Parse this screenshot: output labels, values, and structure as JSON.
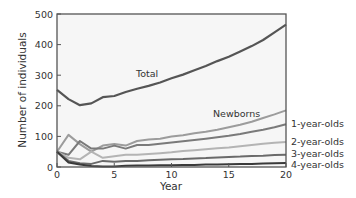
{
  "chart_data": {
    "type": "line",
    "title": "",
    "xlabel": "Year",
    "ylabel": "Number of individuals",
    "xlim": [
      0,
      20
    ],
    "ylim": [
      0,
      500
    ],
    "xticks": [
      0,
      5,
      10,
      15,
      20
    ],
    "yticks": [
      0,
      100,
      200,
      300,
      400,
      500
    ],
    "grid": false,
    "legend": "inline labels",
    "x": [
      0,
      1,
      2,
      3,
      4,
      5,
      6,
      7,
      8,
      9,
      10,
      11,
      12,
      13,
      14,
      15,
      16,
      17,
      18,
      19,
      20
    ],
    "series": [
      {
        "name": "Total",
        "color": "#555555",
        "values": [
          252,
          222,
          202,
          208,
          228,
          232,
          245,
          256,
          265,
          276,
          290,
          302,
          316,
          330,
          346,
          360,
          377,
          395,
          415,
          440,
          465
        ]
      },
      {
        "name": "Newborns",
        "color": "#9c9c9c",
        "values": [
          50,
          105,
          75,
          50,
          70,
          75,
          70,
          85,
          90,
          92,
          100,
          104,
          110,
          115,
          122,
          130,
          138,
          148,
          160,
          172,
          185
        ]
      },
      {
        "name": "1-year-olds",
        "color": "#7a7a7a",
        "values": [
          50,
          40,
          85,
          60,
          60,
          70,
          60,
          72,
          72,
          76,
          80,
          84,
          88,
          92,
          97,
          102,
          108,
          115,
          122,
          130,
          140
        ]
      },
      {
        "name": "2-year-olds",
        "color": "#b4b4b4",
        "values": [
          50,
          30,
          25,
          50,
          30,
          35,
          40,
          40,
          42,
          45,
          48,
          52,
          55,
          58,
          61,
          64,
          68,
          72,
          76,
          79,
          82
        ]
      },
      {
        "name": "3-year-olds",
        "color": "#6a6a6a",
        "values": [
          50,
          20,
          12,
          10,
          20,
          17,
          20,
          20,
          22,
          24,
          25,
          26,
          28,
          29,
          31,
          33,
          34,
          36,
          37,
          39,
          40
        ]
      },
      {
        "name": "4-year-olds",
        "color": "#3a3a3a",
        "values": [
          50,
          15,
          8,
          3,
          2,
          2,
          4,
          5,
          5,
          6,
          6,
          7,
          7,
          8,
          8,
          9,
          10,
          10,
          11,
          12,
          13
        ]
      }
    ],
    "annotations": [
      {
        "text": "Total",
        "x": 8,
        "y": 305
      },
      {
        "text": "Newborns",
        "x": 14,
        "y": 205
      }
    ]
  },
  "labels": {
    "ylabel": "Number of individuals",
    "xlabel": "Year",
    "total": "Total",
    "newborns": "Newborns",
    "one": "1-year-olds",
    "two": "2-year-olds",
    "three": "3-year-olds",
    "four": "4-year-olds"
  }
}
